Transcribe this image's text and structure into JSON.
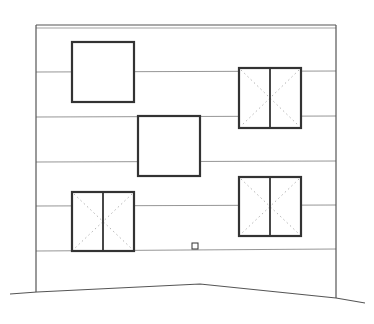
{
  "drawing": {
    "type": "building-elevation",
    "width": 374,
    "height": 324,
    "colors": {
      "background": "#ffffff",
      "outline": "#555555",
      "thin_line": "#8a8a8a",
      "window_frame": "#333333",
      "hidden_line": "#aaaaaa"
    },
    "facade": {
      "left": 36,
      "right": 336,
      "top": 25,
      "top_inner": 28,
      "bottom_left": 292,
      "bottom_right": 298
    },
    "floor_lines": [
      {
        "y_left": 72,
        "y_right": 71
      },
      {
        "y_left": 117,
        "y_right": 116
      },
      {
        "y_left": 162,
        "y_right": 161
      },
      {
        "y_left": 206,
        "y_right": 205
      },
      {
        "y_left": 251,
        "y_right": 249
      }
    ],
    "windows": [
      {
        "id": "window-1",
        "x": 72,
        "y": 42,
        "w": 62,
        "h": 60,
        "type": "fixed"
      },
      {
        "id": "window-2",
        "x": 239,
        "y": 68,
        "w": 62,
        "h": 60,
        "type": "casement-double"
      },
      {
        "id": "window-3",
        "x": 138,
        "y": 116,
        "w": 62,
        "h": 60,
        "type": "fixed"
      },
      {
        "id": "window-4",
        "x": 72,
        "y": 192,
        "w": 62,
        "h": 59,
        "type": "casement-double"
      },
      {
        "id": "window-5",
        "x": 239,
        "y": 177,
        "w": 62,
        "h": 59,
        "type": "casement-double"
      }
    ],
    "vent": {
      "x": 192,
      "y": 243,
      "w": 6,
      "h": 6
    },
    "ground_line": [
      [
        10,
        294
      ],
      [
        37,
        292
      ],
      [
        200,
        284
      ],
      [
        336,
        298
      ],
      [
        365,
        303
      ]
    ]
  }
}
